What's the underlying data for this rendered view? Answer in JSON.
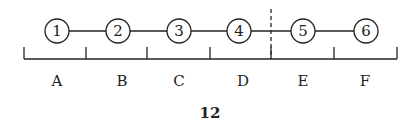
{
  "diagram": {
    "nodes": [
      {
        "label": "1",
        "x": 57,
        "y": 31
      },
      {
        "label": "2",
        "x": 118,
        "y": 31
      },
      {
        "label": "3",
        "x": 179,
        "y": 31
      },
      {
        "label": "4",
        "x": 239,
        "y": 31
      },
      {
        "label": "5",
        "x": 303,
        "y": 31
      },
      {
        "label": "6",
        "x": 366,
        "y": 31
      }
    ],
    "segments": [
      {
        "label": "A",
        "x": 57
      },
      {
        "label": "B",
        "x": 122
      },
      {
        "label": "C",
        "x": 179
      },
      {
        "label": "D",
        "x": 243
      },
      {
        "label": "E",
        "x": 303
      },
      {
        "label": "F",
        "x": 365
      }
    ],
    "ticks_x": [
      24,
      86,
      147,
      210,
      271,
      334,
      397
    ],
    "divider_x": 271
  },
  "page_number": "12"
}
